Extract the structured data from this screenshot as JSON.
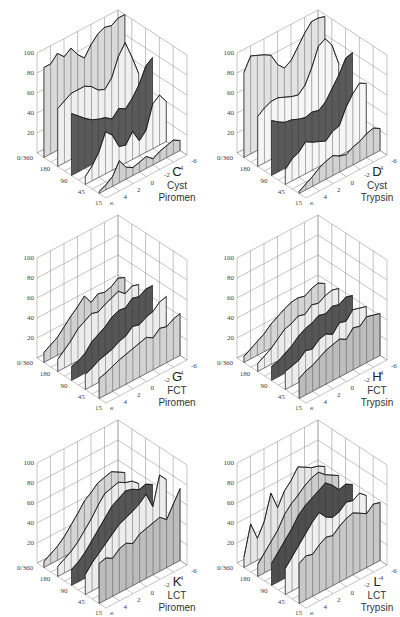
{
  "figure": {
    "z_axis_ticks": [
      "0/360",
      "20",
      "40",
      "60",
      "80",
      "100"
    ],
    "angle_axis_ticks": [
      "0/360",
      "180",
      "90",
      "45",
      "15"
    ],
    "depth_axis_ticks": [
      "6",
      "4",
      "2",
      "0",
      "-2",
      "-4",
      "-6"
    ]
  },
  "chart_data": [
    {
      "id": "C",
      "type": "area",
      "letter": "C",
      "line1": "Cyst",
      "line2": "Piromen",
      "zlabel_ticks": [
        0,
        20,
        40,
        60,
        80,
        100
      ],
      "ylim": [
        0,
        100
      ],
      "x": [
        -6,
        -5,
        -4,
        -3,
        -2,
        -1,
        0,
        1,
        2,
        3,
        4,
        5,
        6
      ],
      "series": [
        {
          "name": "180",
          "shade": "#d9d9d9",
          "values": [
            90,
            90,
            97,
            90,
            95,
            85,
            78,
            88,
            95,
            98,
            96,
            100,
            100
          ]
        },
        {
          "name": "90",
          "shade": "#f0f0f0",
          "values": [
            58,
            62,
            66,
            66,
            66,
            62,
            55,
            52,
            60,
            78,
            88,
            70,
            50
          ]
        },
        {
          "name": "45",
          "shade": "#5a5a5a",
          "values": [
            62,
            56,
            50,
            45,
            42,
            40,
            35,
            42,
            38,
            45,
            55,
            70,
            75
          ]
        },
        {
          "name": "15",
          "shade": "#f4f4f4",
          "values": [
            8,
            15,
            25,
            42,
            35,
            20,
            18,
            28,
            15,
            22,
            45,
            50,
            40
          ]
        },
        {
          "name": "6",
          "shade": "#cfcfcf",
          "values": [
            2,
            5,
            10,
            22,
            12,
            8,
            10,
            12,
            6,
            10,
            12,
            14,
            10
          ]
        }
      ]
    },
    {
      "id": "D",
      "type": "area",
      "letter": "D",
      "line1": "Cyst",
      "line2": "Trypsin",
      "zlabel_ticks": [
        0,
        20,
        40,
        60,
        80,
        100
      ],
      "ylim": [
        0,
        100
      ],
      "x": [
        -6,
        -5,
        -4,
        -3,
        -2,
        -1,
        0,
        1,
        2,
        3,
        4,
        5,
        6
      ],
      "series": [
        {
          "name": "180",
          "shade": "#e2e2e2",
          "values": [
            85,
            98,
            95,
            92,
            88,
            75,
            68,
            72,
            82,
            92,
            100,
            100,
            98
          ]
        },
        {
          "name": "90",
          "shade": "#f6f6f6",
          "values": [
            50,
            55,
            58,
            58,
            55,
            52,
            50,
            56,
            70,
            88,
            92,
            82,
            60
          ]
        },
        {
          "name": "45",
          "shade": "#5a5a5a",
          "values": [
            55,
            50,
            46,
            45,
            42,
            40,
            42,
            40,
            45,
            55,
            65,
            78,
            80
          ]
        },
        {
          "name": "15",
          "shade": "#f6f6f6",
          "values": [
            15,
            22,
            25,
            32,
            28,
            25,
            22,
            28,
            30,
            45,
            55,
            62,
            58
          ]
        },
        {
          "name": "6",
          "shade": "#d2d2d2",
          "values": [
            2,
            6,
            10,
            15,
            18,
            20,
            16,
            14,
            18,
            20,
            24,
            26,
            22
          ]
        }
      ]
    },
    {
      "id": "G",
      "type": "area",
      "letter": "G",
      "line1": "FCT",
      "line2": "Piromen",
      "zlabel_ticks": [
        0,
        20,
        40,
        60,
        80,
        100
      ],
      "ylim": [
        0,
        100
      ],
      "x": [
        -6,
        -5,
        -4,
        -3,
        -2,
        -1,
        0,
        1,
        2,
        3,
        4,
        5,
        6
      ],
      "series": [
        {
          "name": "180",
          "shade": "#d0d0d0",
          "values": [
            10,
            14,
            18,
            25,
            32,
            38,
            45,
            35,
            40,
            38,
            40,
            45,
            42
          ]
        },
        {
          "name": "90",
          "shade": "#ececec",
          "values": [
            12,
            18,
            24,
            32,
            36,
            40,
            38,
            42,
            45,
            48,
            42,
            46,
            44
          ]
        },
        {
          "name": "45",
          "shade": "#555555",
          "values": [
            14,
            16,
            20,
            28,
            32,
            36,
            42,
            45,
            44,
            50,
            48,
            52,
            52
          ]
        },
        {
          "name": "15",
          "shade": "#ececec",
          "values": [
            15,
            18,
            22,
            24,
            26,
            30,
            32,
            38,
            36,
            40,
            42,
            48,
            50
          ]
        },
        {
          "name": "6",
          "shade": "#d2d2d2",
          "values": [
            20,
            22,
            25,
            28,
            30,
            32,
            34,
            36,
            32,
            38,
            36,
            40,
            42
          ]
        }
      ]
    },
    {
      "id": "H",
      "type": "area",
      "letter": "H",
      "line1": "FCT",
      "line2": "Trypsin",
      "zlabel_ticks": [
        0,
        20,
        40,
        60,
        80,
        100
      ],
      "ylim": [
        0,
        100
      ],
      "x": [
        -6,
        -5,
        -4,
        -3,
        -2,
        -1,
        0,
        1,
        2,
        3,
        4,
        5,
        6
      ],
      "series": [
        {
          "name": "180",
          "shade": "#d4d4d4",
          "values": [
            6,
            10,
            14,
            18,
            24,
            28,
            32,
            35,
            36,
            34,
            38,
            40,
            36
          ]
        },
        {
          "name": "90",
          "shade": "#ececec",
          "values": [
            8,
            12,
            16,
            22,
            28,
            30,
            34,
            32,
            38,
            36,
            40,
            42,
            40
          ]
        },
        {
          "name": "45",
          "shade": "#555555",
          "values": [
            14,
            16,
            20,
            24,
            30,
            34,
            36,
            40,
            38,
            42,
            40,
            44,
            42
          ]
        },
        {
          "name": "15",
          "shade": "#ececec",
          "values": [
            18,
            20,
            22,
            28,
            26,
            32,
            34,
            30,
            38,
            36,
            44,
            42,
            40
          ]
        },
        {
          "name": "6",
          "shade": "#bdbdbd",
          "values": [
            20,
            24,
            26,
            30,
            34,
            36,
            38,
            34,
            42,
            40,
            46,
            44,
            42
          ]
        }
      ]
    },
    {
      "id": "K",
      "type": "area",
      "letter": "K",
      "line1": "LCT",
      "line2": "Piromen",
      "zlabel_ticks": [
        0,
        20,
        40,
        60,
        80,
        100
      ],
      "ylim": [
        0,
        100
      ],
      "x": [
        -6,
        -5,
        -4,
        -3,
        -2,
        -1,
        0,
        1,
        2,
        3,
        4,
        5,
        6
      ],
      "series": [
        {
          "name": "180",
          "shade": "#d4d4d4",
          "values": [
            6,
            10,
            14,
            20,
            28,
            36,
            45,
            50,
            56,
            58,
            60,
            56,
            52
          ]
        },
        {
          "name": "90",
          "shade": "#ececec",
          "values": [
            10,
            14,
            18,
            24,
            32,
            40,
            50,
            58,
            60,
            62,
            58,
            56,
            50
          ]
        },
        {
          "name": "45",
          "shade": "#555555",
          "values": [
            16,
            20,
            26,
            34,
            42,
            50,
            58,
            62,
            66,
            64,
            60,
            62,
            58
          ]
        },
        {
          "name": "15",
          "shade": "#ececec",
          "values": [
            20,
            28,
            34,
            40,
            46,
            52,
            55,
            58,
            62,
            68,
            52,
            80,
            72
          ]
        },
        {
          "name": "6",
          "shade": "#bdbdbd",
          "values": [
            40,
            42,
            38,
            44,
            46,
            42,
            48,
            50,
            52,
            54,
            48,
            60,
            72
          ]
        }
      ]
    },
    {
      "id": "L",
      "type": "area",
      "letter": "L",
      "line1": "LCT",
      "line2": "Trypsin",
      "zlabel_ticks": [
        0,
        20,
        40,
        60,
        80,
        100
      ],
      "ylim": [
        0,
        100
      ],
      "x": [
        -6,
        -5,
        -4,
        -3,
        -2,
        -1,
        0,
        1,
        2,
        3,
        4,
        5,
        6
      ],
      "series": [
        {
          "name": "180",
          "shade": "#e6e6e6",
          "values": [
            10,
            40,
            22,
            35,
            60,
            42,
            55,
            62,
            72,
            68,
            64,
            62,
            58
          ]
        },
        {
          "name": "90",
          "shade": "#cccccc",
          "values": [
            12,
            20,
            28,
            36,
            48,
            55,
            60,
            66,
            70,
            72,
            66,
            62,
            58
          ]
        },
        {
          "name": "45",
          "shade": "#4e4e4e",
          "values": [
            22,
            30,
            38,
            46,
            56,
            62,
            66,
            70,
            74,
            68,
            60,
            62,
            58
          ]
        },
        {
          "name": "15",
          "shade": "#f0f0f0",
          "values": [
            26,
            34,
            42,
            50,
            58,
            64,
            56,
            52,
            54,
            60,
            58,
            62,
            56
          ]
        },
        {
          "name": "6",
          "shade": "#c8c8c8",
          "values": [
            40,
            44,
            42,
            48,
            52,
            50,
            56,
            60,
            62,
            58,
            54,
            60,
            58
          ]
        }
      ]
    }
  ]
}
